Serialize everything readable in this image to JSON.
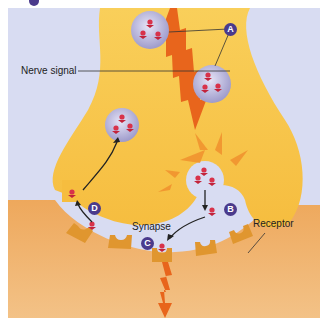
{
  "diagram": {
    "labels": {
      "nerve_signal": "Nerve signal",
      "synapse": "Synapse",
      "receptor": "Receptor"
    },
    "badges": {
      "a": "A",
      "b": "B",
      "c": "C",
      "d": "D"
    },
    "colors": {
      "background": "#d8dcf2",
      "presynaptic": "#f7c44e",
      "presynaptic_light": "#fbe08e",
      "postsynaptic": "#eba35a",
      "postsynaptic_light": "#f2bb7a",
      "receptor": "#e0962f",
      "signal_arrow": "#e8651c",
      "vesicle": "#b8b6de",
      "neurotransmitter": "#d8324a",
      "badge": "#4a3a8c"
    }
  }
}
